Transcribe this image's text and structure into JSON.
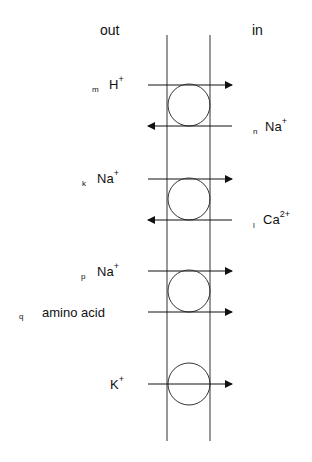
{
  "sides": {
    "out": "out",
    "in": "in"
  },
  "transporters": [
    {
      "id": 1,
      "flows": [
        {
          "tag": "m",
          "ion": "H",
          "charge": "+",
          "side": "out",
          "direction": "out-to-in"
        },
        {
          "tag": "n",
          "ion": "Na",
          "charge": "+",
          "side": "in",
          "direction": "in-to-out"
        }
      ]
    },
    {
      "id": 2,
      "flows": [
        {
          "tag": "k",
          "ion": "Na",
          "charge": "+",
          "side": "out",
          "direction": "out-to-in"
        },
        {
          "tag": "l",
          "ion": "Ca",
          "charge": "2+",
          "side": "in",
          "direction": "in-to-out"
        }
      ]
    },
    {
      "id": 3,
      "flows": [
        {
          "tag": "p",
          "ion": "Na",
          "charge": "+",
          "side": "out",
          "direction": "out-to-in"
        },
        {
          "tag": "q",
          "ion": "amino acid",
          "charge": "",
          "side": "out",
          "direction": "out-to-in"
        }
      ]
    },
    {
      "id": 4,
      "flows": [
        {
          "tag": "",
          "ion": "K",
          "charge": "+",
          "side": "out",
          "direction": "out-to-in"
        }
      ]
    }
  ]
}
